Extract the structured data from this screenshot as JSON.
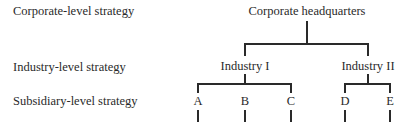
{
  "levels": [
    {
      "label": "Corporate-level strategy"
    },
    {
      "label": "Industry-level strategy"
    },
    {
      "label": "Subsidiary-level strategy"
    }
  ],
  "root": {
    "label": "Corporate headquarters"
  },
  "industries": [
    {
      "label": "Industry I",
      "subsidiaries": [
        "A",
        "B",
        "C"
      ]
    },
    {
      "label": "Industry II",
      "subsidiaries": [
        "D",
        "E"
      ]
    }
  ],
  "subsidiaries": [
    {
      "label": "A"
    },
    {
      "label": "B"
    },
    {
      "label": "C"
    },
    {
      "label": "D"
    },
    {
      "label": "E"
    }
  ],
  "colors": {
    "line": "#2a2a2a",
    "text": "#2a2a2a",
    "background": "#ffffff"
  }
}
